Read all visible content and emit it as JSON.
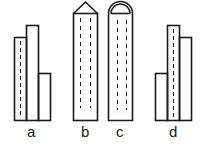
{
  "figures": [
    {
      "id": "a",
      "label": "a",
      "description": "three adjacent rectangles of differing heights, dashes in left one"
    },
    {
      "id": "b",
      "label": "b",
      "description": "tall rectangle with pointed triangular top, two dashed lines"
    },
    {
      "id": "c",
      "label": "c",
      "description": "tall rectangle with rounded semicircular top, two dashed lines"
    },
    {
      "id": "d",
      "label": "d",
      "description": "three adjacent rectangles of differing heights, dashes in middle one"
    }
  ],
  "colors": {
    "stroke": "#1a1a1a",
    "background": "#ffffff"
  }
}
